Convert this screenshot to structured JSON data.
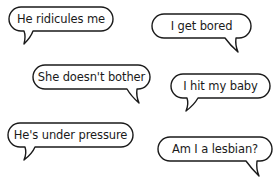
{
  "bubbles": [
    {
      "text": "He ridicules me",
      "tail": "bottom-left"
    },
    {
      "text": "I get bored",
      "tail": "bottom-right"
    },
    {
      "text": "She doesn't bother",
      "tail": "bottom-right"
    },
    {
      "text": "I hit my baby",
      "tail": "bottom-left"
    },
    {
      "text": "He's under pressure",
      "tail": "bottom-left"
    },
    {
      "text": "Am I a lesbian?",
      "tail": "bottom-right"
    }
  ],
  "colors": {
    "outline": "#1a1a1a",
    "fill": "#ffffff",
    "background": "#ffffff"
  }
}
